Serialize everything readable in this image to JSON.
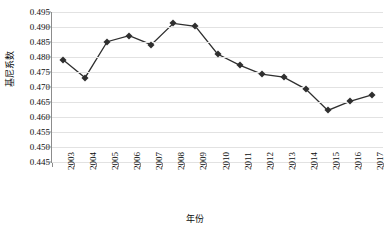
{
  "chart_data": {
    "type": "line",
    "title": "",
    "subtitle": "",
    "xlabel": "年份",
    "ylabel": "基尼系数",
    "categories": [
      "2003",
      "2004",
      "2005",
      "2006",
      "2007",
      "2008",
      "2009",
      "2010",
      "2011",
      "2012",
      "2013",
      "2014",
      "2015",
      "2016",
      "2017"
    ],
    "values": [
      0.4791,
      0.4731,
      0.4851,
      0.4871,
      0.4841,
      0.4912,
      0.4902,
      0.481,
      0.4773,
      0.4743,
      0.4733,
      0.4693,
      0.4622,
      0.4652,
      0.4674
    ],
    "series": [
      {
        "name": "基尼系数",
        "values": [
          0.4791,
          0.4731,
          0.4851,
          0.4871,
          0.4841,
          0.4912,
          0.4902,
          0.481,
          0.4773,
          0.4743,
          0.4733,
          0.4693,
          0.4622,
          0.4652,
          0.4674
        ]
      }
    ],
    "ylim": [
      0.445,
      0.495
    ],
    "ytick_step": 0.005,
    "ytick_labels": [
      "0.495",
      "0.490",
      "0.485",
      "0.480",
      "0.475",
      "0.470",
      "0.465",
      "0.460",
      "0.455",
      "0.450",
      "0.445"
    ],
    "ytick_values": [
      0.495,
      0.49,
      0.485,
      0.48,
      0.475,
      0.47,
      0.465,
      0.46,
      0.455,
      0.45,
      0.445
    ],
    "grid": "horizontal",
    "legend": "none",
    "marker": "diamond",
    "colors": {
      "line": "#2f2f2f",
      "marker": "#2f2f2f",
      "gridline": "#e2e2e2",
      "axis": "#8c8c8c",
      "text": "#0d0d0d",
      "background": "#ffffff"
    }
  }
}
